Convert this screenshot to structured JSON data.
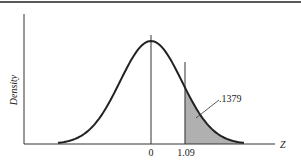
{
  "chart_data": {
    "type": "area",
    "title": "",
    "xlabel": "Z",
    "ylabel": "Density",
    "distribution": "standard normal",
    "x_ticks": [
      "0",
      "1.09"
    ],
    "x_tick_values": [
      0,
      1.09
    ],
    "shaded_region": {
      "from": 1.09,
      "to": "infinity",
      "area_label": ".1379",
      "area_value": 0.1379
    },
    "vertical_lines": [
      0,
      1.09
    ],
    "xlim": [
      -3,
      3
    ],
    "grid": false,
    "legend": null
  },
  "labels": {
    "ylabel": "Density",
    "xlabel": "Z",
    "tick0": "0",
    "tick1": "1.09",
    "area": ".1379"
  },
  "colors": {
    "curve": "#222222",
    "shade": "#b0b0b0",
    "axis": "#333333"
  }
}
